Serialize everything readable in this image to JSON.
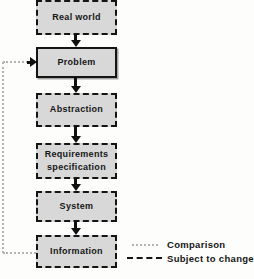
{
  "diagram": {
    "boxes": [
      {
        "id": "real-world",
        "label": "Real world",
        "border": "dashed"
      },
      {
        "id": "problem",
        "label": "Problem",
        "border": "solid"
      },
      {
        "id": "abstraction",
        "label": "Abstraction",
        "border": "dashed"
      },
      {
        "id": "requirements",
        "label": "Requirements specification",
        "border": "dashed"
      },
      {
        "id": "system",
        "label": "System",
        "border": "dashed"
      },
      {
        "id": "information",
        "label": "Information",
        "border": "dashed"
      }
    ],
    "flow": [
      "Real world",
      "Problem",
      "Abstraction",
      "Requirements specification",
      "System",
      "Information"
    ],
    "feedback_loop": {
      "from": "Information",
      "to": "Problem",
      "style": "dotted-gray"
    },
    "legend": [
      {
        "label": "Comparison",
        "line_style": "dotted-gray"
      },
      {
        "label": "Subject to change",
        "line_style": "dashed-black"
      }
    ],
    "colors": {
      "box_fill": "#d8d8d8",
      "line_black": "#111111",
      "comparison_gray": "#b3b3b3",
      "background": "#fdfdfc"
    }
  }
}
